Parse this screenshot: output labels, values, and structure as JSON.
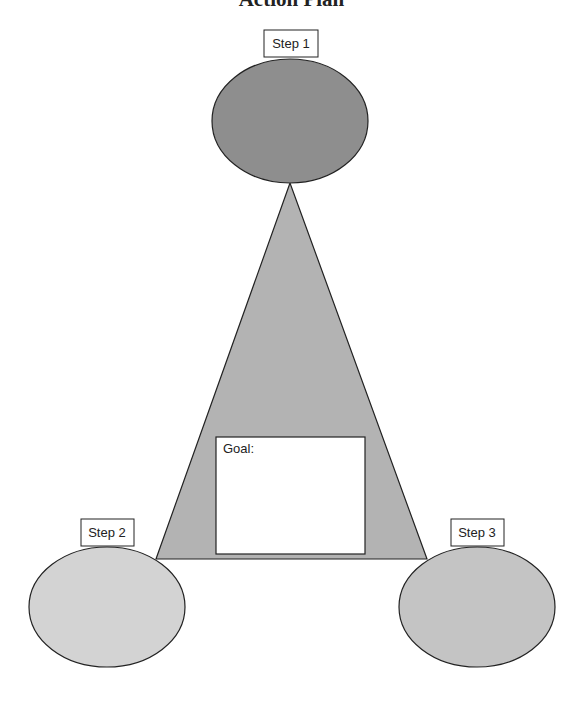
{
  "title": "Action Plan",
  "steps": [
    {
      "label": "Step 1",
      "fill": "#8e8e8e"
    },
    {
      "label": "Step 2",
      "fill": "#d3d3d3"
    },
    {
      "label": "Step 3",
      "fill": "#c4c4c4"
    }
  ],
  "goal": {
    "label": "Goal:",
    "value": ""
  },
  "triangle": {
    "fill": "#b3b3b3"
  }
}
